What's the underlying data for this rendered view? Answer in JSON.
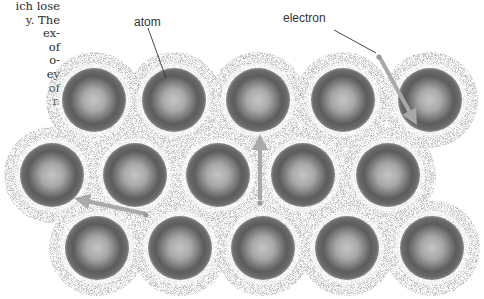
{
  "side_text": {
    "lines": [
      "ich lose",
      "y. The",
      "ex-",
      "of",
      "o-",
      "ey",
      "of",
      "n"
    ]
  },
  "labels": {
    "atom": "atom",
    "electron": "electron"
  },
  "colors": {
    "atom_dark": "#555555",
    "atom_light": "#bdbdbd",
    "cloud": "#9a9a9a",
    "arrow": "#a9a9a9",
    "leader_line": "#333333",
    "text": "#2a2a2a"
  },
  "lattice": {
    "atom_radius": 32,
    "cloud_radius": 48,
    "rows": [
      {
        "y": 100,
        "x": [
          94,
          174,
          258,
          343,
          430
        ]
      },
      {
        "y": 175,
        "x": [
          52,
          135,
          218,
          303,
          388
        ]
      },
      {
        "y": 248,
        "x": [
          97,
          180,
          263,
          347,
          432
        ]
      }
    ]
  },
  "arrows": [
    {
      "name": "electron-arrow-down-right",
      "x1": 380,
      "y1": 58,
      "x2": 413,
      "y2": 118
    },
    {
      "name": "electron-arrow-up",
      "x1": 260,
      "y1": 200,
      "x2": 260,
      "y2": 142
    },
    {
      "name": "electron-arrow-left",
      "x1": 146,
      "y1": 214,
      "x2": 82,
      "y2": 200
    }
  ],
  "electrons": [
    {
      "x": 379,
      "y": 57
    },
    {
      "x": 260,
      "y": 203
    },
    {
      "x": 146,
      "y": 215
    }
  ]
}
